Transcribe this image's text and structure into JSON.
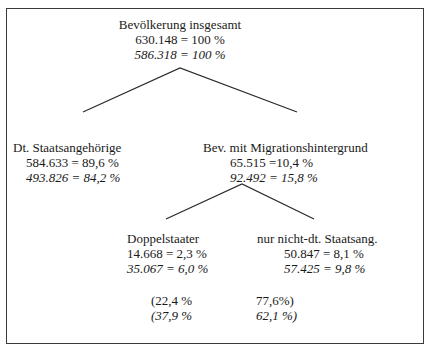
{
  "root": {
    "label": "Bevölkerung insgesamt",
    "value_a": "630.148 = 100 %",
    "value_b": "586.318 = 100 %"
  },
  "german": {
    "label": "Dt. Staatsangehörige",
    "value_a": "584.633 = 89,6 %",
    "value_b": "493.826 = 84,2 %"
  },
  "migration": {
    "label": "Bev. mit Migrationshintergrund",
    "value_a": "65.515 =10,4 %",
    "value_b": "92.492 = 15,8 %"
  },
  "dual": {
    "label": "Doppelstaater",
    "value_a": "14.668 = 2,3 %",
    "value_b": "35.067 = 6,0 %"
  },
  "foreign": {
    "label": "nur nicht-dt. Staatsang.",
    "value_a": "50.847 = 8,1 %",
    "value_b": "57.425 = 9,8 %"
  },
  "shares": {
    "dual_a": "(22,4 %",
    "dual_b": "(37,9 %",
    "foreign_a": "77,6%)",
    "foreign_b": "62,1 %)"
  }
}
